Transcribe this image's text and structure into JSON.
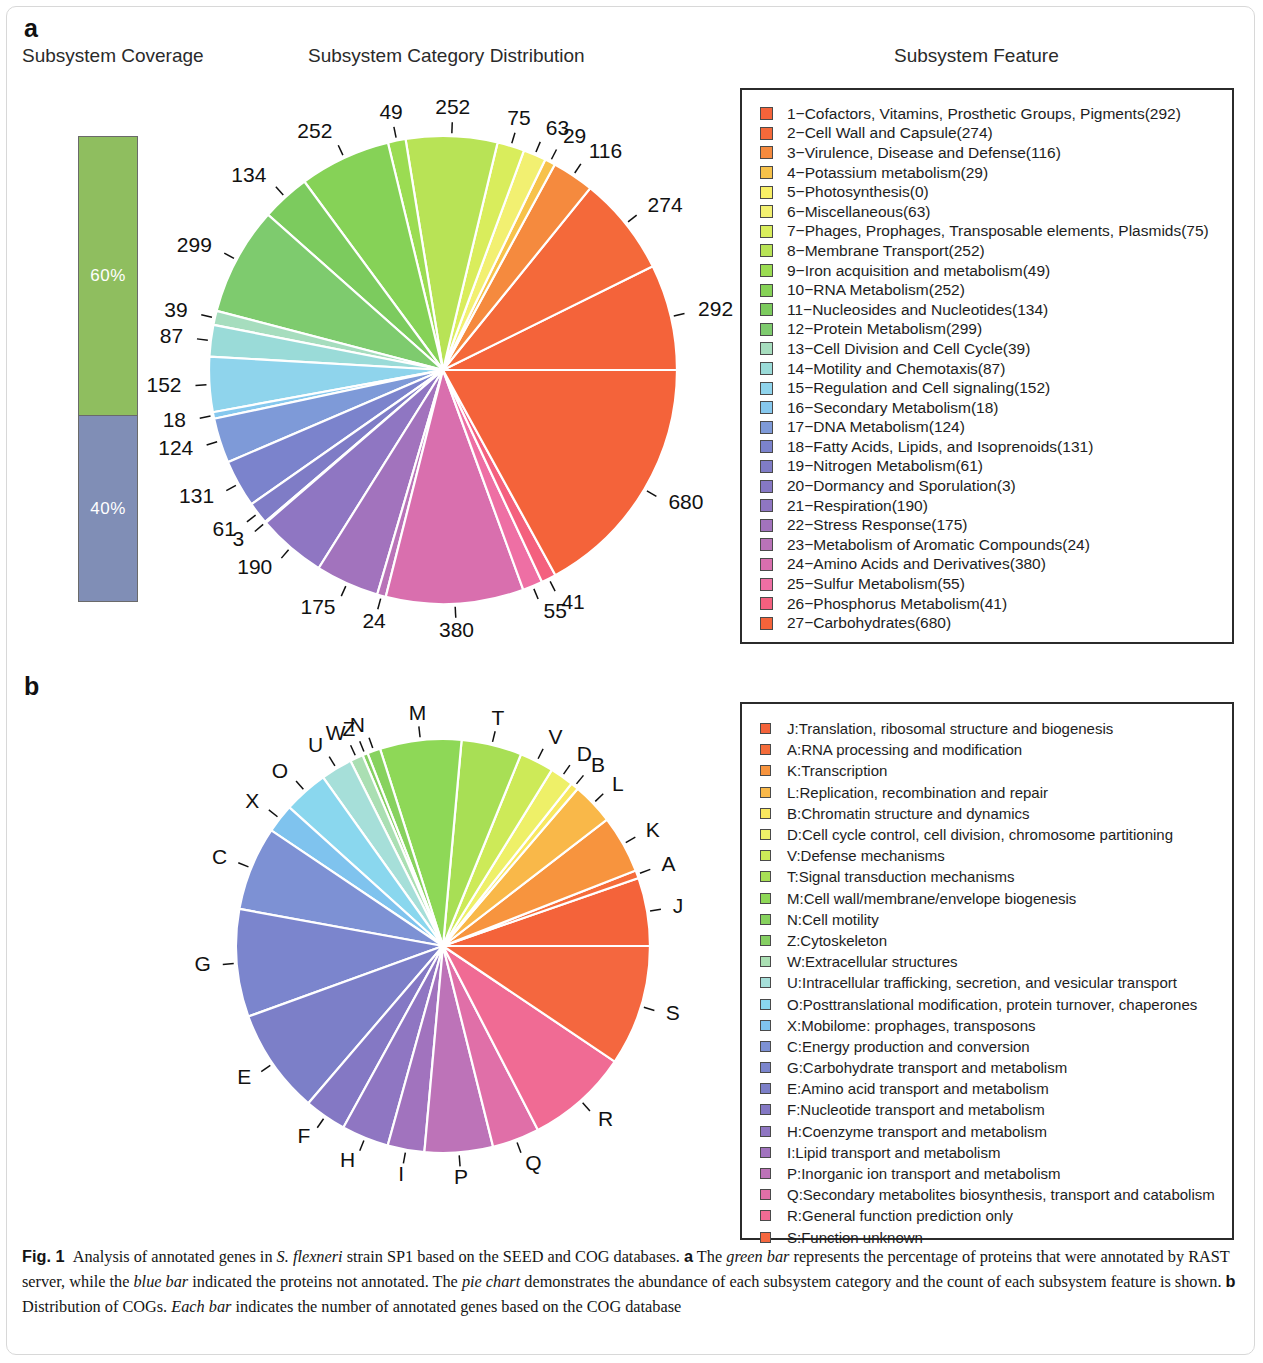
{
  "panels": {
    "a_letter": "a",
    "b_letter": "b"
  },
  "headers": {
    "coverage": "Subsystem Coverage",
    "category_distribution": "Subsystem Category Distribution",
    "subsystem_feature": "Subsystem Feature"
  },
  "coverage": {
    "segments": [
      {
        "label": "60%",
        "value": 60,
        "color": "#8fbe5f",
        "name": "annotated"
      },
      {
        "label": "40%",
        "value": 40,
        "color": "#808eb6",
        "name": "not-annotated"
      }
    ]
  },
  "chart_data": [
    {
      "type": "pie",
      "id": "subsystem-category-pie",
      "title": "Subsystem Category Distribution",
      "start_angle_deg": 0,
      "direction": "counterclockwise",
      "labels_are": "counts",
      "categories": [
        "Cofactors, Vitamins, Prosthetic Groups, Pigments",
        "Cell Wall and Capsule",
        "Virulence, Disease and Defense",
        "Potassium metabolism",
        "Photosynthesis",
        "Miscellaneous",
        "Phages, Prophages, Transposable elements, Plasmids",
        "Membrane Transport",
        "Iron acquisition and metabolism",
        "RNA Metabolism",
        "Nucleosides and Nucleotides",
        "Protein Metabolism",
        "Cell Division and Cell Cycle",
        "Motility and Chemotaxis",
        "Regulation and Cell signaling",
        "Secondary Metabolism",
        "DNA Metabolism",
        "Fatty Acids, Lipids, and Isoprenoids",
        "Nitrogen Metabolism",
        "Dormancy and Sporulation",
        "Respiration",
        "Stress Response",
        "Metabolism of Aromatic Compounds",
        "Amino Acids and Derivatives",
        "Sulfur Metabolism",
        "Phosphorus Metabolism",
        "Carbohydrates"
      ],
      "values": [
        292,
        274,
        116,
        29,
        0,
        63,
        75,
        252,
        49,
        252,
        134,
        299,
        39,
        87,
        152,
        18,
        124,
        131,
        61,
        3,
        190,
        175,
        24,
        380,
        55,
        41,
        680
      ],
      "colors": [
        "#f4633a",
        "#f4693a",
        "#f58a3e",
        "#f7c24a",
        "#f8ef66",
        "#f2f071",
        "#d9ed5c",
        "#b8e356",
        "#9bdc52",
        "#86d257",
        "#7ccb5e",
        "#7ecb6e",
        "#a6ddbe",
        "#9adbd8",
        "#8fd4ec",
        "#86c8ee",
        "#7e9ad8",
        "#7b83cc",
        "#7f7cc6",
        "#8678c4",
        "#8f76c2",
        "#a273bd",
        "#b973b8",
        "#d96fae",
        "#ee6fa4",
        "#f4607e",
        "#f4633a"
      ]
    },
    {
      "type": "pie",
      "id": "cog-distribution-pie",
      "title": "Distribution of COGs",
      "start_angle_deg": 0,
      "direction": "counterclockwise",
      "labels_are": "cog-letter-codes",
      "categories": [
        "J",
        "A",
        "K",
        "L",
        "B",
        "D",
        "V",
        "T",
        "M",
        "N",
        "Z",
        "W",
        "U",
        "O",
        "X",
        "C",
        "G",
        "E",
        "F",
        "H",
        "I",
        "P",
        "Q",
        "R",
        "S"
      ],
      "values": [
        26,
        3,
        22,
        16,
        3,
        9,
        13,
        23,
        31,
        5,
        2,
        5,
        12,
        17,
        11,
        32,
        41,
        40,
        16,
        18,
        14,
        26,
        18,
        39,
        46
      ],
      "colors": [
        "#f4633a",
        "#f56c3a",
        "#f7943e",
        "#f9b849",
        "#f8e75f",
        "#eef068",
        "#cdea58",
        "#a8df55",
        "#8ed857",
        "#87d25e",
        "#85cf62",
        "#aadfb3",
        "#a6dfd9",
        "#8ad7ee",
        "#7fc3ee",
        "#7d91d4",
        "#7b85cd",
        "#7c7fc8",
        "#8478c4",
        "#8f76c2",
        "#a173be",
        "#bd73b8",
        "#e06fa8",
        "#f06b94",
        "#f4673f"
      ]
    }
  ],
  "legend_seed": {
    "title": "Subsystem Feature",
    "items": [
      {
        "index": "1",
        "label": "1−Cofactors, Vitamins, Prosthetic Groups, Pigments(292)",
        "color": "#f4633a"
      },
      {
        "index": "2",
        "label": "2−Cell Wall and Capsule(274)",
        "color": "#f4693a"
      },
      {
        "index": "3",
        "label": "3−Virulence, Disease and Defense(116)",
        "color": "#f58a3e"
      },
      {
        "index": "4",
        "label": "4−Potassium metabolism(29)",
        "color": "#f7c24a"
      },
      {
        "index": "5",
        "label": "5−Photosynthesis(0)",
        "color": "#f8ef66"
      },
      {
        "index": "6",
        "label": "6−Miscellaneous(63)",
        "color": "#f2f071"
      },
      {
        "index": "7",
        "label": "7−Phages, Prophages, Transposable elements, Plasmids(75)",
        "color": "#d9ed5c"
      },
      {
        "index": "8",
        "label": "8−Membrane Transport(252)",
        "color": "#b8e356"
      },
      {
        "index": "9",
        "label": "9−Iron acquisition and metabolism(49)",
        "color": "#9bdc52"
      },
      {
        "index": "10",
        "label": "10−RNA Metabolism(252)",
        "color": "#86d257"
      },
      {
        "index": "11",
        "label": "11−Nucleosides and Nucleotides(134)",
        "color": "#7ccb5e"
      },
      {
        "index": "12",
        "label": "12−Protein Metabolism(299)",
        "color": "#7ecb6e"
      },
      {
        "index": "13",
        "label": "13−Cell Division and Cell Cycle(39)",
        "color": "#a6ddbe"
      },
      {
        "index": "14",
        "label": "14−Motility and Chemotaxis(87)",
        "color": "#9adbd8"
      },
      {
        "index": "15",
        "label": "15−Regulation and Cell signaling(152)",
        "color": "#8fd4ec"
      },
      {
        "index": "16",
        "label": "16−Secondary Metabolism(18)",
        "color": "#86c8ee"
      },
      {
        "index": "17",
        "label": "17−DNA Metabolism(124)",
        "color": "#7e9ad8"
      },
      {
        "index": "18",
        "label": "18−Fatty Acids, Lipids, and Isoprenoids(131)",
        "color": "#7b83cc"
      },
      {
        "index": "19",
        "label": "19−Nitrogen Metabolism(61)",
        "color": "#7f7cc6"
      },
      {
        "index": "20",
        "label": "20−Dormancy and Sporulation(3)",
        "color": "#8678c4"
      },
      {
        "index": "21",
        "label": "21−Respiration(190)",
        "color": "#8f76c2"
      },
      {
        "index": "22",
        "label": "22−Stress Response(175)",
        "color": "#a273bd"
      },
      {
        "index": "23",
        "label": "23−Metabolism of Aromatic Compounds(24)",
        "color": "#b973b8"
      },
      {
        "index": "24",
        "label": "24−Amino Acids and Derivatives(380)",
        "color": "#d96fae"
      },
      {
        "index": "25",
        "label": "25−Sulfur Metabolism(55)",
        "color": "#ee6fa4"
      },
      {
        "index": "26",
        "label": "26−Phosphorus Metabolism(41)",
        "color": "#f4607e"
      },
      {
        "index": "27",
        "label": "27−Carbohydrates(680)",
        "color": "#f4633a"
      }
    ]
  },
  "legend_cog": {
    "items": [
      {
        "code": "J",
        "label": "J:Translation, ribosomal structure and biogenesis",
        "color": "#f4633a"
      },
      {
        "code": "A",
        "label": "A:RNA processing and modification",
        "color": "#f56c3a"
      },
      {
        "code": "K",
        "label": "K:Transcription",
        "color": "#f7943e"
      },
      {
        "code": "L",
        "label": "L:Replication, recombination and repair",
        "color": "#f9b849"
      },
      {
        "code": "B",
        "label": "B:Chromatin structure and dynamics",
        "color": "#f8e75f"
      },
      {
        "code": "D",
        "label": "D:Cell cycle control, cell division, chromosome partitioning",
        "color": "#eef068"
      },
      {
        "code": "V",
        "label": "V:Defense mechanisms",
        "color": "#cdea58"
      },
      {
        "code": "T",
        "label": "T:Signal transduction mechanisms",
        "color": "#a8df55"
      },
      {
        "code": "M",
        "label": "M:Cell wall/membrane/envelope biogenesis",
        "color": "#8ed857"
      },
      {
        "code": "N",
        "label": "N:Cell motility",
        "color": "#87d25e"
      },
      {
        "code": "Z",
        "label": "Z:Cytoskeleton",
        "color": "#85cf62"
      },
      {
        "code": "W",
        "label": "W:Extracellular structures",
        "color": "#aadfb3"
      },
      {
        "code": "U",
        "label": "U:Intracellular trafficking, secretion, and vesicular transport",
        "color": "#a6dfd9"
      },
      {
        "code": "O",
        "label": "O:Posttranslational modification, protein turnover, chaperones",
        "color": "#8ad7ee"
      },
      {
        "code": "X",
        "label": "X:Mobilome: prophages, transposons",
        "color": "#7fc3ee"
      },
      {
        "code": "C",
        "label": "C:Energy production and conversion",
        "color": "#7d91d4"
      },
      {
        "code": "G",
        "label": "G:Carbohydrate transport and metabolism",
        "color": "#7b85cd"
      },
      {
        "code": "E",
        "label": "E:Amino acid transport and metabolism",
        "color": "#7c7fc8"
      },
      {
        "code": "F",
        "label": "F:Nucleotide transport and metabolism",
        "color": "#8478c4"
      },
      {
        "code": "H",
        "label": "H:Coenzyme transport and metabolism",
        "color": "#8f76c2"
      },
      {
        "code": "I",
        "label": "I:Lipid transport and metabolism",
        "color": "#a173be"
      },
      {
        "code": "P",
        "label": "P:Inorganic ion transport and metabolism",
        "color": "#bd73b8"
      },
      {
        "code": "Q",
        "label": "Q:Secondary metabolites biosynthesis, transport and catabolism",
        "color": "#e06fa8"
      },
      {
        "code": "R",
        "label": "R:General function prediction only",
        "color": "#f06b94"
      },
      {
        "code": "S",
        "label": "S:Function unknown",
        "color": "#f4673f"
      }
    ]
  },
  "caption": {
    "fig_label": "Fig. 1",
    "text_1": "Analysis of annotated genes in ",
    "italic_1": "S. flexneri",
    "text_2": " strain SP1 based on the SEED and COG databases. ",
    "bold_a": "a",
    "text_3": " The ",
    "italic_2": "green bar",
    "text_4": " represents the percentage of proteins that were annotated by RAST server, while the ",
    "italic_3": "blue bar",
    "text_5": " indicated the proteins not annotated. The ",
    "italic_4": "pie chart",
    "text_6": " demonstrates the abundance of each subsystem category and the count of each subsystem feature is shown. ",
    "bold_b": "b",
    "text_7": " Distribution of COGs. ",
    "italic_5": "Each bar",
    "text_8": " indicates the number of annotated genes based on the COG database"
  }
}
